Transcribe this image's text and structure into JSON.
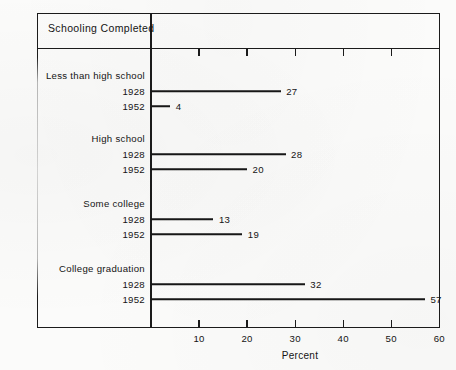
{
  "header": {
    "title": "Schooling Completed"
  },
  "chart_data": {
    "type": "bar",
    "orientation": "horizontal",
    "title": "Schooling Completed",
    "xlabel": "Percent",
    "ylabel": "",
    "xlim": [
      0,
      60
    ],
    "xticks": [
      10,
      20,
      30,
      40,
      50,
      60
    ],
    "xtick_labels": [
      "10",
      "20",
      "30",
      "40",
      "50",
      "60"
    ],
    "top_axis_ticks": [
      10,
      20,
      30,
      40,
      50
    ],
    "grid": false,
    "legend": null,
    "categories": [
      "Less than high school",
      "High school",
      "Some college",
      "College graduation"
    ],
    "series": [
      {
        "name": "1928",
        "values": [
          27,
          28,
          13,
          32
        ]
      },
      {
        "name": "1952",
        "values": [
          4,
          20,
          19,
          57
        ]
      }
    ],
    "groups": [
      {
        "category": "Less than high school",
        "bars": [
          {
            "year": "1928",
            "value": 27,
            "label": "27"
          },
          {
            "year": "1952",
            "value": 4,
            "label": "4"
          }
        ]
      },
      {
        "category": "High school",
        "bars": [
          {
            "year": "1928",
            "value": 28,
            "label": "28"
          },
          {
            "year": "1952",
            "value": 20,
            "label": "20"
          }
        ]
      },
      {
        "category": "Some college",
        "bars": [
          {
            "year": "1928",
            "value": 13,
            "label": "13"
          },
          {
            "year": "1952",
            "value": 19,
            "label": "19"
          }
        ]
      },
      {
        "category": "College graduation",
        "bars": [
          {
            "year": "1928",
            "value": 32,
            "label": "32"
          },
          {
            "year": "1952",
            "value": 57,
            "label": "57"
          }
        ]
      }
    ],
    "colors": {
      "ink": "#171717",
      "frame": "#1b1b1b",
      "background": "#fbfbfa"
    }
  }
}
